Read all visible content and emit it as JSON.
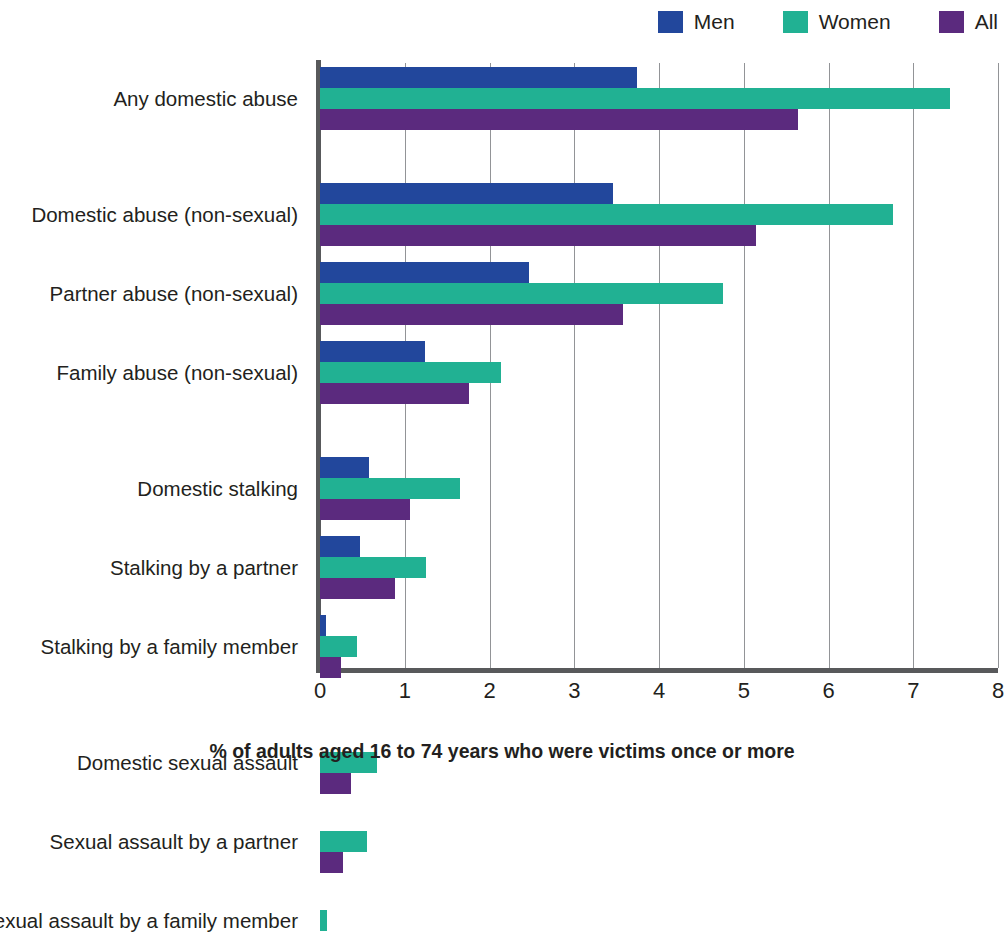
{
  "legend": {
    "items": [
      {
        "label": "Men",
        "color": "#22479C",
        "icon": "legend-swatch-icon"
      },
      {
        "label": "Women",
        "color": "#21B193",
        "icon": "legend-swatch-icon"
      },
      {
        "label": "All",
        "color": "#5B2A7E",
        "icon": "legend-swatch-icon"
      }
    ]
  },
  "axis": {
    "x_caption": "% of adults aged 16 to 74 years who were victims once or more",
    "x_ticks": [
      "0",
      "1",
      "2",
      "3",
      "4",
      "5",
      "6",
      "7",
      "8"
    ]
  },
  "chart_data": {
    "type": "bar",
    "orientation": "horizontal",
    "title": "",
    "subtitle": "",
    "xlabel": "% of adults aged 16 to 74 years who were victims once or more",
    "ylabel": "",
    "xlim": [
      0,
      8
    ],
    "xticks": [
      0,
      1,
      2,
      3,
      4,
      5,
      6,
      7,
      8
    ],
    "grid": true,
    "legend_position": "top-right",
    "categories": [
      "Any domestic abuse",
      "Domestic abuse (non-sexual)",
      "Partner abuse (non-sexual)",
      "Family abuse (non-sexual)",
      "Domestic stalking",
      "Stalking by a partner",
      "Stalking by a family member",
      "Domestic sexual assault",
      "Sexual assault by a partner",
      "Sexual assault by a family member"
    ],
    "series": [
      {
        "name": "Men",
        "color": "#22479C",
        "values": [
          3.74,
          3.46,
          2.47,
          1.24,
          0.58,
          0.47,
          0.07,
          0.0,
          0.0,
          0.0
        ]
      },
      {
        "name": "Women",
        "color": "#21B193",
        "values": [
          7.43,
          6.76,
          4.76,
          2.13,
          1.65,
          1.25,
          0.44,
          0.67,
          0.55,
          0.08
        ]
      },
      {
        "name": "All",
        "color": "#5B2A7E",
        "values": [
          5.64,
          5.14,
          3.57,
          1.76,
          1.06,
          0.88,
          0.25,
          0.37,
          0.27,
          0.0
        ]
      }
    ]
  }
}
